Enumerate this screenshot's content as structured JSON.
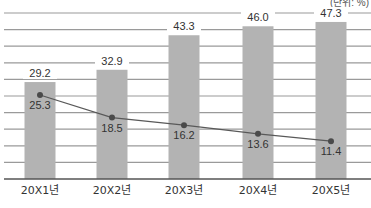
{
  "chart_data": {
    "type": "bar",
    "title": "",
    "unit_label": "(단위: %)",
    "xlabel": "",
    "ylabel": "",
    "ylim": [
      0,
      50
    ],
    "grid": true,
    "grid_step": 5,
    "legend": null,
    "categories": [
      "20X1년",
      "20X2년",
      "20X3년",
      "20X4년",
      "20X5년"
    ],
    "series": [
      {
        "name": "bar-series",
        "type": "bar",
        "color": "#b3b3b3",
        "values": [
          29.2,
          32.9,
          43.3,
          46.0,
          47.3
        ],
        "labels": [
          "29.2",
          "32.9",
          "43.3",
          "46.0",
          "47.3"
        ]
      },
      {
        "name": "line-series",
        "type": "line",
        "color": "#595959",
        "values": [
          25.3,
          18.5,
          16.2,
          13.6,
          11.4
        ],
        "labels": [
          "25.3",
          "18.5",
          "16.2",
          "13.6",
          "11.4"
        ]
      }
    ]
  },
  "colors": {
    "grid": "#9a9a9a",
    "axis": "#555555",
    "text": "#333333",
    "bar": "#b3b3b3",
    "line": "#595959"
  }
}
